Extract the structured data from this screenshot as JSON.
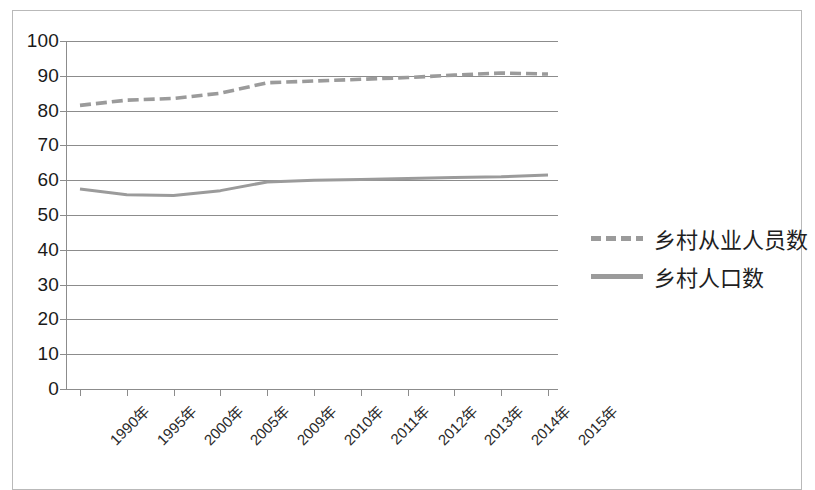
{
  "chart_data": {
    "type": "line",
    "title": "",
    "xlabel": "",
    "ylabel": "",
    "ylim": [
      0,
      100
    ],
    "ytick_step": 10,
    "grid": true,
    "legend_position": "right",
    "categories": [
      "1990年",
      "1995年",
      "2000年",
      "2005年",
      "2009年",
      "2010年",
      "2011年",
      "2012年",
      "2013年",
      "2014年",
      "2015年"
    ],
    "ytick_labels": [
      "100",
      "90",
      "80",
      "70",
      "60",
      "50",
      "40",
      "30",
      "20",
      "10",
      "0"
    ],
    "ytick_values": [
      100,
      90,
      80,
      70,
      60,
      50,
      40,
      30,
      20,
      10,
      0
    ],
    "series": [
      {
        "name": "乡村从业人员数",
        "style": "dashed",
        "color": "#9b9b9b",
        "values": [
          81.5,
          83.0,
          83.5,
          85.0,
          88.0,
          88.5,
          89.0,
          89.5,
          90.2,
          90.8,
          90.5
        ]
      },
      {
        "name": "乡村人口数",
        "style": "solid",
        "color": "#9b9b9b",
        "values": [
          57.5,
          55.8,
          55.6,
          57.0,
          59.5,
          60.0,
          60.2,
          60.5,
          60.8,
          61.0,
          61.5
        ]
      }
    ]
  },
  "legend": {
    "items": [
      {
        "label": "乡村从业人员数",
        "style": "dashed"
      },
      {
        "label": "乡村人口数",
        "style": "solid"
      }
    ]
  },
  "colors": {
    "line": "#9b9b9b",
    "grid": "#8c8c8c",
    "frame": "#b9b9b9",
    "text": "#1a1a1a"
  }
}
